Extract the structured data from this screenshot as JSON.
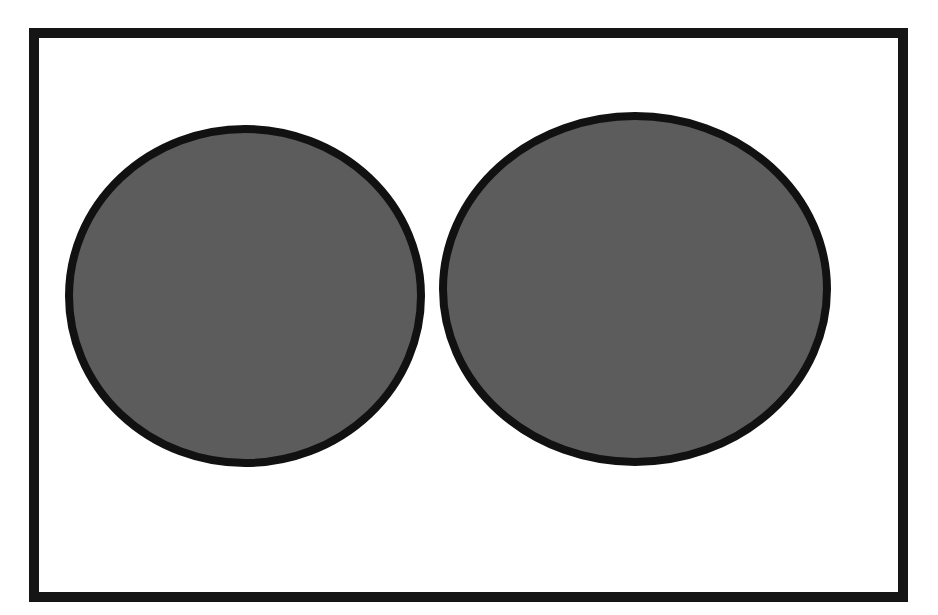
{
  "diagram": {
    "type": "venn-like-two-sets",
    "background_color": "#ffffff",
    "frame": {
      "x": 34,
      "y": 33,
      "width": 869,
      "height": 564,
      "stroke_color": "#151515",
      "stroke_width": 10
    },
    "shapes": [
      {
        "id": "left-circle",
        "cx": 245,
        "cy": 296,
        "rx": 176,
        "ry": 167,
        "fill": "#5c5c5c",
        "stroke": "#111111",
        "stroke_width": 8
      },
      {
        "id": "right-ellipse",
        "cx": 635,
        "cy": 289,
        "rx": 192,
        "ry": 173,
        "fill": "#5c5c5c",
        "stroke": "#111111",
        "stroke_width": 8
      }
    ]
  }
}
